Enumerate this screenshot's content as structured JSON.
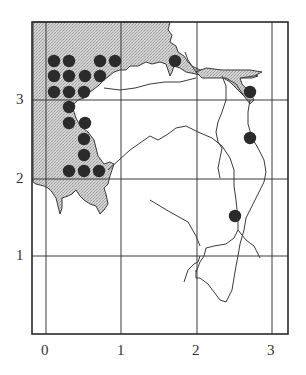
{
  "map": {
    "frame": {
      "left": 32,
      "top": 22,
      "right": 288,
      "bottom": 334
    },
    "x_axis": {
      "ticks": [
        {
          "label": "0",
          "px": 46
        },
        {
          "label": "1",
          "px": 121
        },
        {
          "label": "2",
          "px": 197
        },
        {
          "label": "3",
          "px": 272
        }
      ]
    },
    "y_axis": {
      "ticks": [
        {
          "label": "3",
          "px": 100
        },
        {
          "label": "2",
          "px": 179
        },
        {
          "label": "1",
          "px": 256
        }
      ]
    },
    "colors": {
      "land_shaded": "#c8c8c8",
      "line": "#3a3a3a",
      "dot": "#2b2b2b",
      "background": "#ffffff"
    },
    "dots": [
      {
        "x": 54,
        "y": 61
      },
      {
        "x": 69,
        "y": 61
      },
      {
        "x": 100,
        "y": 61
      },
      {
        "x": 115,
        "y": 61
      },
      {
        "x": 54,
        "y": 76
      },
      {
        "x": 69,
        "y": 76
      },
      {
        "x": 85,
        "y": 76
      },
      {
        "x": 100,
        "y": 76
      },
      {
        "x": 54,
        "y": 92
      },
      {
        "x": 69,
        "y": 92
      },
      {
        "x": 84,
        "y": 92
      },
      {
        "x": 69,
        "y": 107
      },
      {
        "x": 69,
        "y": 123
      },
      {
        "x": 85,
        "y": 123
      },
      {
        "x": 84,
        "y": 139
      },
      {
        "x": 84,
        "y": 155
      },
      {
        "x": 69,
        "y": 171
      },
      {
        "x": 84,
        "y": 171
      },
      {
        "x": 99,
        "y": 171
      },
      {
        "x": 175,
        "y": 61
      },
      {
        "x": 250,
        "y": 92
      },
      {
        "x": 250,
        "y": 138
      },
      {
        "x": 235,
        "y": 216
      }
    ]
  }
}
